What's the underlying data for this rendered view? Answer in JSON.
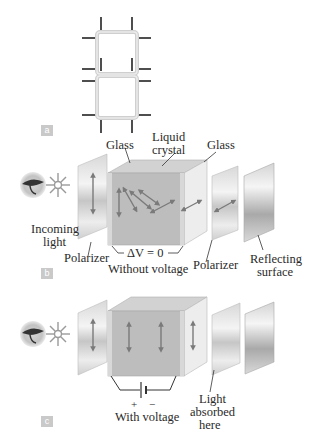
{
  "panels": {
    "a": {
      "tag": "a",
      "description": "Seven-segment style display digit with electrode leads"
    },
    "b": {
      "tag": "b",
      "labels": {
        "glass_left": "Glass",
        "liquid_crystal_line1": "Liquid",
        "liquid_crystal_line2": "crystal",
        "glass_right": "Glass",
        "incoming_light_line1": "Incoming",
        "incoming_light_line2": "light",
        "polarizer_left": "Polarizer",
        "delta_v": "ΔV = 0",
        "without_voltage": "Without voltage",
        "polarizer_right": "Polarizer",
        "reflecting_line1": "Reflecting",
        "reflecting_line2": "surface"
      }
    },
    "c": {
      "tag": "c",
      "labels": {
        "plus": "+",
        "minus": "−",
        "with_voltage": "With voltage",
        "absorbed_line1": "Light",
        "absorbed_line2": "absorbed",
        "absorbed_line3": "here"
      }
    }
  },
  "icons": [
    "eye-icon",
    "light-source-star-icon",
    "polarization-arrow-icon",
    "battery-icon"
  ],
  "colors": {
    "plate_gray": "#c8c8c8",
    "cube_front": "#b9b9b9",
    "cube_side": "#dedede",
    "arrow": "#7a7a7a",
    "tag_bg": "#c9c9c9"
  }
}
